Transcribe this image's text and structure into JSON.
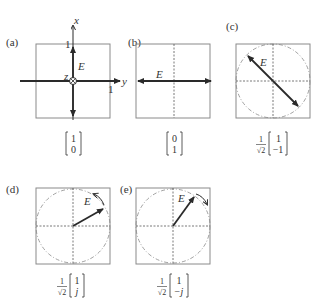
{
  "figure": {
    "panels": [
      {
        "id": "a",
        "label": "(a)",
        "field_label": "E",
        "axis_x_label": "x",
        "axis_y_label": "y",
        "axis_z_label": "z",
        "tick_x": "1",
        "tick_y": "1",
        "vector_prefix": "",
        "vector_top": "1",
        "vector_bottom": "0",
        "polarization": "linear-vertical"
      },
      {
        "id": "b",
        "label": "(b)",
        "field_label": "E",
        "vector_prefix": "",
        "vector_top": "0",
        "vector_bottom": "1",
        "polarization": "linear-horizontal"
      },
      {
        "id": "c",
        "label": "(c)",
        "field_label": "E",
        "vector_prefix_num": "1",
        "vector_prefix_den": "√2",
        "vector_top": "1",
        "vector_bottom": "−1",
        "polarization": "linear-diagonal-minus45"
      },
      {
        "id": "d",
        "label": "(d)",
        "field_label": "E",
        "vector_prefix_num": "1",
        "vector_prefix_den": "√2",
        "vector_top": "1",
        "vector_bottom": "j",
        "polarization": "circular-counterclockwise"
      },
      {
        "id": "e",
        "label": "(e)",
        "field_label": "E",
        "vector_prefix_num": "1",
        "vector_prefix_den": "√2",
        "vector_top": "1",
        "vector_bottom": "−j",
        "polarization": "circular-clockwise"
      }
    ],
    "colors": {
      "box": "#8a8a8a",
      "arrow": "#2a2a2a",
      "dashed": "#555555",
      "circle": "#8a8a8a"
    }
  }
}
